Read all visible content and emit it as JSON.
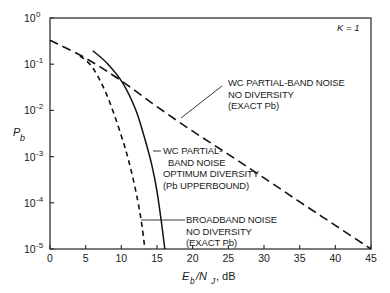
{
  "chart_data": {
    "type": "line",
    "title": "",
    "xlabel": "E_b/N_J, dB",
    "ylabel": "P_b",
    "xlim": [
      0,
      45
    ],
    "ylim": [
      1e-05,
      1
    ],
    "yscale": "log",
    "grid": false,
    "x_ticks": [
      0,
      5,
      10,
      15,
      20,
      25,
      30,
      35,
      40,
      45
    ],
    "x_tick_labels": [
      "0",
      "5",
      "10",
      "15",
      "20",
      "25",
      "30",
      "35",
      "40",
      "45"
    ],
    "y_ticks_log10": [
      0,
      -1,
      -2,
      -3,
      -4,
      -5
    ],
    "y_tick_labels": [
      "10^0",
      "10^-1",
      "10^-2",
      "10^-3",
      "10^-4",
      "10^-5"
    ],
    "annotations": [
      {
        "text": "K = 1",
        "position": "top-right"
      }
    ],
    "series": [
      {
        "name": "WC partial-band noise, no diversity (exact Pb)",
        "style": "long-dash",
        "label_lines": [
          "WC PARTIAL-BAND NOISE",
          "NO DIVERSITY",
          "(EXACT Pb)"
        ],
        "x_db": [
          0,
          5,
          10,
          15,
          20,
          25,
          30,
          35,
          40,
          45
        ],
        "log10_pb": [
          -0.48,
          -0.87,
          -1.36,
          -1.92,
          -2.45,
          -2.95,
          -3.46,
          -3.98,
          -4.49,
          -5.0
        ]
      },
      {
        "name": "WC partial-band noise, optimum diversity (Pb upperbound)",
        "style": "solid",
        "label_lines": [
          "WC PARTIAL-",
          "BAND NOISE",
          "OPTIMUM DIVERSITY",
          "(Pb UPPERBOUND)"
        ],
        "x_db": [
          6.0,
          8.0,
          10.2,
          12.0,
          13.3,
          14.3,
          15.0,
          15.6,
          16.1
        ],
        "log10_pb": [
          -0.71,
          -0.98,
          -1.41,
          -1.98,
          -2.62,
          -3.2,
          -3.75,
          -4.4,
          -5.0
        ]
      },
      {
        "name": "Broadband noise, no diversity (exact Pb)",
        "style": "short-dash",
        "label_lines": [
          "BROADBAND NOISE",
          "NO DIVERSITY",
          "(EXACT Pb)"
        ],
        "x_db": [
          4.2,
          6.0,
          8.0,
          10.0,
          11.3,
          12.3,
          12.9,
          13.3
        ],
        "log10_pb": [
          -0.82,
          -1.08,
          -1.68,
          -2.55,
          -3.25,
          -3.95,
          -4.5,
          -5.0
        ]
      }
    ]
  },
  "labels": {
    "k_label": "K = 1",
    "y_axis_label_main": "P",
    "y_axis_label_sub": "b",
    "x_axis_label_main": "E",
    "x_axis_label_sub1": "b",
    "x_axis_label_mid": "/N",
    "x_axis_label_sub2": "J",
    "x_axis_label_unit": ", dB"
  }
}
